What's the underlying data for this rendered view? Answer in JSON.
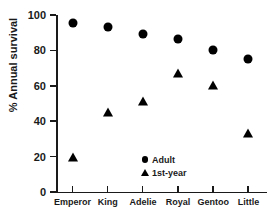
{
  "chart_data": {
    "type": "scatter",
    "title": "",
    "xlabel": "",
    "ylabel": "% Annual survival",
    "categories": [
      "Emperor",
      "King",
      "Adelie",
      "Royal",
      "Gentoo",
      "Little"
    ],
    "series": [
      {
        "name": "Adult",
        "marker": "circle",
        "values": [
          95.5,
          93.5,
          89,
          86.5,
          80,
          75
        ]
      },
      {
        "name": "1st-year",
        "marker": "triangle",
        "values": [
          19.5,
          45,
          51.5,
          67.5,
          60.5,
          33.5
        ]
      }
    ],
    "ylim": [
      0,
      100
    ],
    "yticks": [
      0,
      20,
      40,
      60,
      80,
      100
    ],
    "ytick_labels": [
      "0",
      "20",
      "40",
      "60",
      "80",
      "100"
    ],
    "grid": false,
    "legend_position": "inside-bottom-center",
    "legend": [
      {
        "label": "Adult",
        "marker": "circle"
      },
      {
        "label": "1st-year",
        "marker": "triangle"
      }
    ],
    "marker_color": "#000000",
    "axis_color": "#1a1a1a"
  }
}
